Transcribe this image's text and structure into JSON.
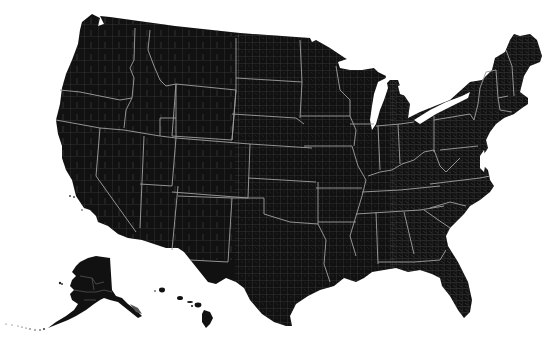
{
  "map": {
    "title": "United States county map",
    "projection": "Albers USA (with Alaska and Hawaii insets)",
    "regions_shown": [
      "Contiguous United States",
      "Alaska",
      "Hawaii"
    ],
    "fill_color": "#111111",
    "county_border_color": "#5a5a5a",
    "state_border_color": "#9a9a9a",
    "background_color": "#ffffff",
    "legend": null,
    "labels": []
  }
}
